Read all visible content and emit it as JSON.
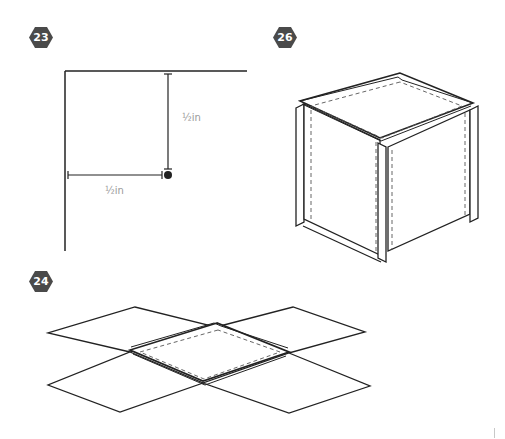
{
  "steps": [
    {
      "number": "23",
      "badge_x": 29,
      "badge_y": 27
    },
    {
      "number": "26",
      "badge_x": 273,
      "badge_y": 27
    },
    {
      "number": "24",
      "badge_x": 29,
      "badge_y": 271
    }
  ],
  "step23": {
    "vertical_dimension_label": "½in",
    "horizontal_dimension_label": "½in"
  },
  "colors": {
    "badge_fill": "#4a4a4a",
    "line": "#222222",
    "dim_text": "#9a9a9a",
    "dashed": "#555555"
  }
}
